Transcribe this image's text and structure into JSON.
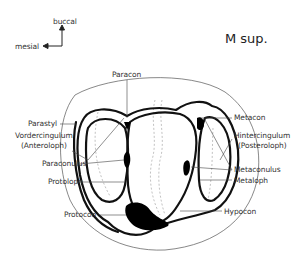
{
  "title": "M sup.",
  "orientation": {
    "up": "buccal",
    "left": "mesial"
  },
  "labels": {
    "paracon": "Paracon",
    "parastyl": "Parastyl",
    "vordercingulum": "Vordercingulum",
    "anteroloph": "(Anteroloph)",
    "paraconulus": "Paraconulus",
    "protoloph": "Protoloph",
    "protocon": "Protocon",
    "metacon": "Metacon",
    "hintercingulum": "Hintercingulum",
    "posteroloph": "(Posteroloph)",
    "metaconulus": "Metaconulus",
    "metaloph": "Metaloph",
    "hypocon": "Hypocon"
  }
}
